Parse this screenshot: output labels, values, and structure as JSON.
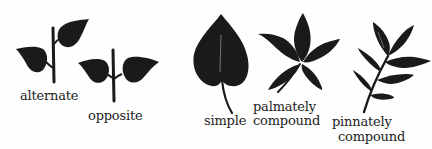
{
  "diagram": {
    "ink_color": "#1a1a1a",
    "background": "#fefefe",
    "items": [
      {
        "id": "alternate",
        "label": "alternate",
        "icon": "alternate-leaves-icon"
      },
      {
        "id": "opposite",
        "label": "opposite",
        "icon": "opposite-leaves-icon"
      },
      {
        "id": "simple",
        "label": "simple",
        "icon": "simple-leaf-icon"
      },
      {
        "id": "palmately-compound",
        "label_line1": "palmately",
        "label_line2": "compound",
        "icon": "palmately-compound-leaf-icon"
      },
      {
        "id": "pinnately-compound",
        "label_line1": "pinnately",
        "label_line2": "compound",
        "icon": "pinnately-compound-leaf-icon"
      }
    ]
  }
}
